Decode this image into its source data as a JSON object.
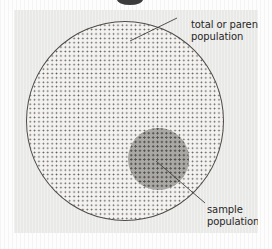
{
  "figure": {
    "type": "venn-style-nested-circles",
    "background_color": "#fdfdfd",
    "panel_color": "#e9e9e7",
    "outline_color": "#4a4642",
    "dot_color": "#56514c",
    "sample_fill_color": "#a9a7a3",
    "text_color": "#1d1b19",
    "top_crop_mark": {
      "name": "cropped-graphic-fragment"
    },
    "shapes": [
      {
        "id": "parent",
        "name": "total-or-parent-population-circle",
        "fill": "dotted",
        "center_x": 125,
        "center_y": 121,
        "diameter": 199
      },
      {
        "id": "sample",
        "name": "sample-population-circle",
        "fill": "gray-dotted",
        "center_x": 158,
        "center_y": 159,
        "diameter": 61
      }
    ],
    "labels": {
      "parent": {
        "line1": "total or parent",
        "line2": "population"
      },
      "sample": {
        "line1": "sample",
        "line2": "population"
      }
    },
    "leaders": [
      {
        "name": "parent-leader-line",
        "from_x": 177,
        "from_y": 18,
        "to_x": 130,
        "to_y": 41
      },
      {
        "name": "sample-leader-line",
        "from_x": 205,
        "from_y": 203,
        "to_x": 156,
        "to_y": 161
      }
    ]
  }
}
